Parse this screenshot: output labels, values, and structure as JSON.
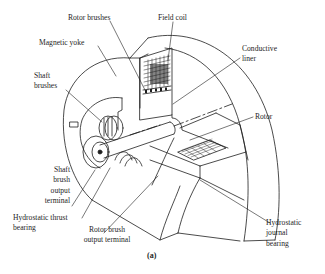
{
  "figure": {
    "caption": "(a)",
    "labels": {
      "rotor_brushes": "Rotor brushes",
      "field_coil": "Field coil",
      "magnetic_yoke": "Magnetic yoke",
      "conductive_liner": "Conductive\nliner",
      "shaft_brushes": "Shaft\nbrushes",
      "rotor": "Rotor",
      "shaft_brush_output_terminal": "Shaft\nbrush\noutput\nterminal",
      "hydrostatic_thrust_bearing": "Hydrostatic thrust\nbearing",
      "rotor_brush_output_terminal": "Rotor brush\noutput terminal",
      "hydrostatic_journal_bearing": "Hydrostatic\njournal\nbearing"
    },
    "colors": {
      "ink": "#1e1e1e",
      "background": "#ffffff"
    }
  }
}
